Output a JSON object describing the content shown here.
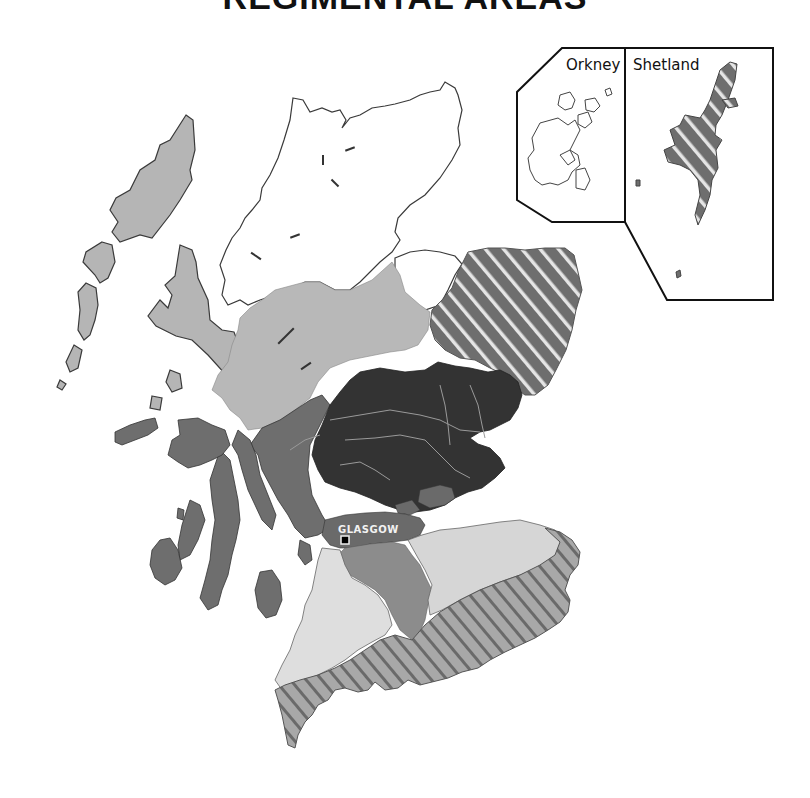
{
  "title": "REGIMENTAL AREAS",
  "colors": {
    "background": "#ffffff",
    "outline": "#333333",
    "highlands_north_white": "#ffffff",
    "western_isles_light_grey": "#b5b5b5",
    "central_highlands_light_grey": "#b8b8b8",
    "west_mid_grey": "#6e6e6e",
    "central_dark": "#333333",
    "glasgow_mid_grey": "#6a6a6a",
    "ayrshire_lanark_grey": "#8c8c8c",
    "southwest_very_light": "#dedede",
    "borders_hatched_base": "#a8a8a8",
    "hatch_stripe_dark": "#6a6a6a",
    "northeast_hatched_base": "#6e6e6e",
    "hatch_stripe_light": "#e5e5e5",
    "rivers": "#9a9a9a"
  },
  "insets": [
    {
      "id": "orkney",
      "label": "Orkney"
    },
    {
      "id": "shetland",
      "label": "Shetland"
    }
  ],
  "cities": [
    {
      "id": "glasgow",
      "label": "GLASGOW",
      "marker": "square"
    }
  ],
  "regions": [
    {
      "id": "far-north",
      "fill": "white"
    },
    {
      "id": "western-isles-and-skye",
      "fill": "light grey"
    },
    {
      "id": "central-highlands",
      "fill": "light grey"
    },
    {
      "id": "north-east",
      "fill": "hatched dark"
    },
    {
      "id": "argyll-west",
      "fill": "mid grey"
    },
    {
      "id": "tayside-fife",
      "fill": "dark"
    },
    {
      "id": "glasgow-area",
      "fill": "mid grey"
    },
    {
      "id": "lanark",
      "fill": "grey"
    },
    {
      "id": "south-west",
      "fill": "very light grey"
    },
    {
      "id": "lothian",
      "fill": "very light grey"
    },
    {
      "id": "borders-dumfries",
      "fill": "hatched light"
    }
  ]
}
